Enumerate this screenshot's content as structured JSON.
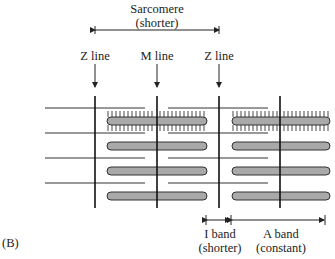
{
  "figure": {
    "panel_label": "(B)",
    "sarcomere": {
      "title": "Sarcomere",
      "subtitle": "(shorter)"
    },
    "lines": {
      "z_left": "Z line",
      "m": "M line",
      "z_right": "Z line"
    },
    "i_band": {
      "title": "I band",
      "subtitle": "(shorter)"
    },
    "a_band": {
      "title": "A band",
      "subtitle": "(constant)"
    },
    "colors": {
      "thick_filament": "#a9a9a9",
      "line": "#222222"
    }
  }
}
